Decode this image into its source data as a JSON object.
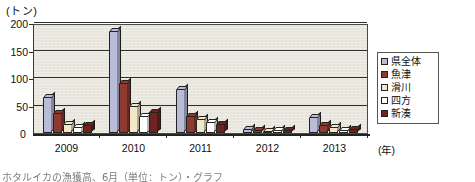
{
  "axis": {
    "y_unit_label": "(トン)",
    "x_unit_label": "(年)",
    "zero_label": "0",
    "y_ticks": [
      "200",
      "150",
      "100",
      "50"
    ]
  },
  "legend": {
    "items": [
      {
        "label": "県全体",
        "color": "#b8bcd8"
      },
      {
        "label": "魚津",
        "color": "#8e3a31"
      },
      {
        "label": "滑川",
        "color": "#f2e7c9"
      },
      {
        "label": "四方",
        "color": "#ffffff"
      },
      {
        "label": "新湊",
        "color": "#6d2420"
      }
    ]
  },
  "caption": {
    "text": "ホタルイカの漁獲高、6月（単位：トン）・グラフ"
  },
  "chart_data": {
    "type": "bar",
    "title": "",
    "xlabel": "(年)",
    "ylabel": "(トン)",
    "ylim": [
      0,
      200
    ],
    "ytick_values": [
      0,
      50,
      100,
      150,
      200
    ],
    "grid": true,
    "legend_position": "right",
    "categories": [
      "2009",
      "2010",
      "2011",
      "2012",
      "2013"
    ],
    "series": [
      {
        "name": "県全体",
        "color": "#b8bcd8",
        "values": [
          63,
          183,
          78,
          6,
          28
        ]
      },
      {
        "name": "魚津",
        "color": "#8e3a31",
        "values": [
          34,
          90,
          30,
          3,
          12
        ]
      },
      {
        "name": "滑川",
        "color": "#f2e7c9",
        "values": [
          15,
          47,
          23,
          2,
          9
        ]
      },
      {
        "name": "四方",
        "color": "#ffffff",
        "values": [
          10,
          30,
          18,
          4,
          4
        ]
      },
      {
        "name": "新湊",
        "color": "#6d2420",
        "values": [
          12,
          37,
          15,
          3,
          6
        ]
      }
    ]
  }
}
